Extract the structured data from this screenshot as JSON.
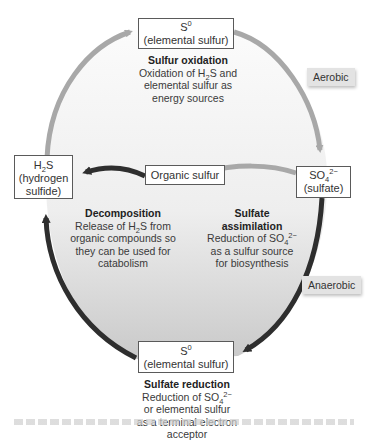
{
  "diagram": {
    "nodes": {
      "top_s0": {
        "line1_main": "S",
        "line1_sup": "0",
        "line2": "(elemental sulfur)"
      },
      "h2s": {
        "line1_a": "H",
        "line1_sub": "2",
        "line1_b": "S",
        "line2": "(hydrogen",
        "line3": "sulfide)"
      },
      "organic": {
        "label": "Organic sulfur"
      },
      "sulfate": {
        "line1_a": "SO",
        "line1_sub": "4",
        "line1_sup": "2−",
        "line2": "(sulfate)"
      },
      "bottom_s0": {
        "line1_main": "S",
        "line1_sup": "0",
        "line2": "(elemental sulfur)"
      }
    },
    "processes": {
      "oxidation": {
        "title": "Sulfur oxidation",
        "l1_a": "Oxidation of H",
        "l1_sub": "2",
        "l1_b": "S and",
        "l2": "elemental sulfur as",
        "l3": "energy sources"
      },
      "decomposition": {
        "title": "Decomposition",
        "l1_a": "Release of H",
        "l1_sub": "2",
        "l1_b": "S from",
        "l2": "organic compounds so",
        "l3": "they can be used for",
        "l4": "catabolism"
      },
      "assimilation": {
        "title1": "Sulfate",
        "title2": "assimilation",
        "l1_a": "Reduction of SO",
        "l1_sub": "4",
        "l1_sup": "2−",
        "l2": "as a sulfur source",
        "l3": "for biosynthesis"
      },
      "reduction": {
        "title": "Sulfate reduction",
        "l1_a": "Reduction of SO",
        "l1_sub": "4",
        "l1_sup": "2−",
        "l2": "or elemental sulfur",
        "l3": "as a terminal electron",
        "l4": "acceptor"
      }
    },
    "tags": {
      "aerobic": "Aerobic",
      "anaerobic": "Anaerobic"
    },
    "colors": {
      "aerobic_arrow": "#a8a8a8",
      "anaerobic_arrow": "#2e2e2e",
      "fill_top": "#f7f7f7",
      "fill_bottom": "#cfcfcf",
      "tag_bg": "#e3e3e3"
    }
  }
}
